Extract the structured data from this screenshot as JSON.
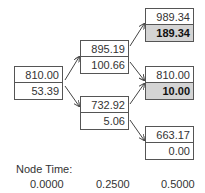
{
  "tree": {
    "nodes": [
      {
        "id": "n0",
        "price": "810.00",
        "value": "53.39",
        "highlight": false
      },
      {
        "id": "n1u",
        "price": "895.19",
        "value": "100.66",
        "highlight": false
      },
      {
        "id": "n1d",
        "price": "732.92",
        "value": "5.06",
        "highlight": false
      },
      {
        "id": "n2uu",
        "price": "989.34",
        "value": "189.34",
        "highlight": true
      },
      {
        "id": "n2ud",
        "price": "810.00",
        "value": "10.00",
        "highlight": true
      },
      {
        "id": "n2dd",
        "price": "663.17",
        "value": "0.00",
        "highlight": false
      }
    ]
  },
  "footer": {
    "node_time_label": "Node Time:",
    "times": [
      "0.0000",
      "0.2500",
      "0.5000"
    ]
  },
  "colors": {
    "highlight": "#d4d4d4",
    "border": "#555555"
  }
}
